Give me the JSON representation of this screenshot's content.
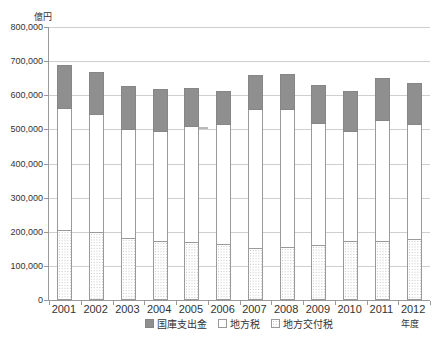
{
  "chart_data": {
    "type": "bar",
    "stacked": true,
    "title": "",
    "unit_label": "億円",
    "xlabel": "年度",
    "categories": [
      "2001",
      "2002",
      "2003",
      "2004",
      "2005",
      "2006",
      "2007",
      "2008",
      "2009",
      "2010",
      "2011",
      "2012"
    ],
    "series": [
      {
        "name": "地方交付税",
        "style": "hatch",
        "values": [
          203000,
          195000,
          180000,
          170000,
          167000,
          160000,
          150000,
          152000,
          159000,
          171000,
          170000,
          175000
        ]
      },
      {
        "name": "地方税",
        "style": "white",
        "values": [
          356000,
          347000,
          319000,
          323000,
          340000,
          352000,
          408000,
          404000,
          358000,
          322000,
          354000,
          338000
        ]
      },
      {
        "name": "国庫支出金",
        "style": "gray",
        "values": [
          130000,
          126000,
          129000,
          124000,
          114000,
          100000,
          100000,
          106000,
          112000,
          120000,
          126000,
          123000
        ]
      }
    ],
    "totals": [
      689000,
      668000,
      628000,
      617000,
      621000,
      612000,
      658000,
      662000,
      629000,
      613000,
      650000,
      636000
    ],
    "legend": [
      {
        "label": "国庫支出金",
        "style": "gray"
      },
      {
        "label": "地方税",
        "style": "white"
      },
      {
        "label": "地方交付税",
        "style": "hatch"
      }
    ],
    "legend_position": "bottom",
    "grid": true,
    "ylim": [
      0,
      800000
    ],
    "ytick_step": 100000,
    "ytick_labels": [
      "0",
      "100,000",
      "200,000",
      "300,000",
      "400,000",
      "500,000",
      "600,000",
      "700,000",
      "800,000"
    ],
    "colors": {
      "bar_gray": "#8f8f8f",
      "bar_white": "#ffffff",
      "hatch_dot": "#bfbfbf",
      "bar_border": "#9a9a9a",
      "gridline": "#cfcfcf",
      "axis": "#9a9a9a",
      "text": "#333333"
    }
  }
}
